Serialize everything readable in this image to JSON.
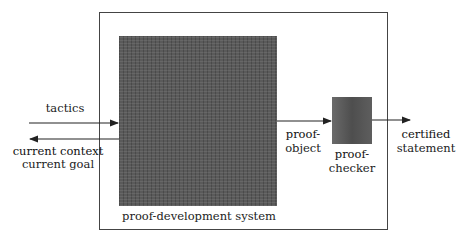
{
  "diagram": {
    "outer_label": "proof-development system",
    "inputs": {
      "tactics": "tactics",
      "current_context": "current context",
      "current_goal": "current goal"
    },
    "proof_object": {
      "line1": "proof-",
      "line2": "object"
    },
    "proof_checker": {
      "line1": "proof-",
      "line2": "checker"
    },
    "output": {
      "line1": "certified",
      "line2": "statement"
    }
  }
}
